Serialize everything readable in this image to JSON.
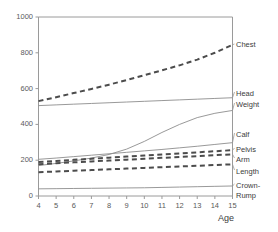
{
  "chart_data": {
    "type": "line",
    "title": "",
    "xlabel": "Age",
    "ylabel": "",
    "xlim": [
      4,
      15
    ],
    "ylim": [
      0,
      1000
    ],
    "grid": false,
    "legend_position": "right-inline",
    "xticks": [
      "4",
      "5",
      "6",
      "7",
      "8",
      "9",
      "10",
      "11",
      "12",
      "13",
      "14",
      "15"
    ],
    "yticks": [
      "0",
      "200",
      "400",
      "600",
      "800",
      "1000"
    ],
    "x": [
      4,
      5,
      6,
      7,
      8,
      9,
      10,
      11,
      12,
      13,
      14,
      15
    ],
    "series": [
      {
        "name": "Chest",
        "style": "dashed",
        "values": [
          530,
          552,
          575,
          598,
          622,
          648,
          675,
          702,
          730,
          762,
          800,
          845
        ]
      },
      {
        "name": "Head",
        "style": "solid",
        "values": [
          505,
          509,
          513,
          517,
          521,
          525,
          529,
          533,
          537,
          541,
          545,
          549
        ]
      },
      {
        "name": "Weight",
        "style": "solid",
        "values": [
          170,
          182,
          196,
          212,
          232,
          262,
          305,
          355,
          400,
          438,
          462,
          478
        ]
      },
      {
        "name": "Calf",
        "style": "solid",
        "values": [
          205,
          212,
          220,
          228,
          236,
          244,
          252,
          260,
          269,
          278,
          288,
          298
        ]
      },
      {
        "name": "Pelvis",
        "style": "dashed",
        "values": [
          190,
          196,
          202,
          208,
          214,
          220,
          226,
          232,
          238,
          244,
          250,
          256
        ]
      },
      {
        "name": "Arm",
        "style": "dashed",
        "values": [
          178,
          183,
          188,
          193,
          198,
          203,
          208,
          213,
          218,
          223,
          228,
          233
        ]
      },
      {
        "name": "Length",
        "style": "dashed",
        "values": [
          133,
          137,
          141,
          145,
          149,
          153,
          157,
          161,
          165,
          169,
          173,
          177
        ]
      },
      {
        "name": "Crown-Rump",
        "style": "solid",
        "values": [
          40,
          41,
          42,
          43,
          44,
          45,
          46,
          48,
          50,
          52,
          54,
          56
        ]
      }
    ]
  },
  "labels": {
    "chest": "Chest",
    "head": "Head",
    "weight": "Weight",
    "calf": "Calf",
    "pelvis": "Pelvis",
    "arm": "Arm",
    "length": "Length",
    "crown": "Crown-",
    "rump": "Rump",
    "age": "Age"
  },
  "colors": {
    "axis": "#9a9a9a",
    "solid_line": "#8d8d8d",
    "dashed_line": "#4c4c4c",
    "text": "#3c3c3c"
  }
}
